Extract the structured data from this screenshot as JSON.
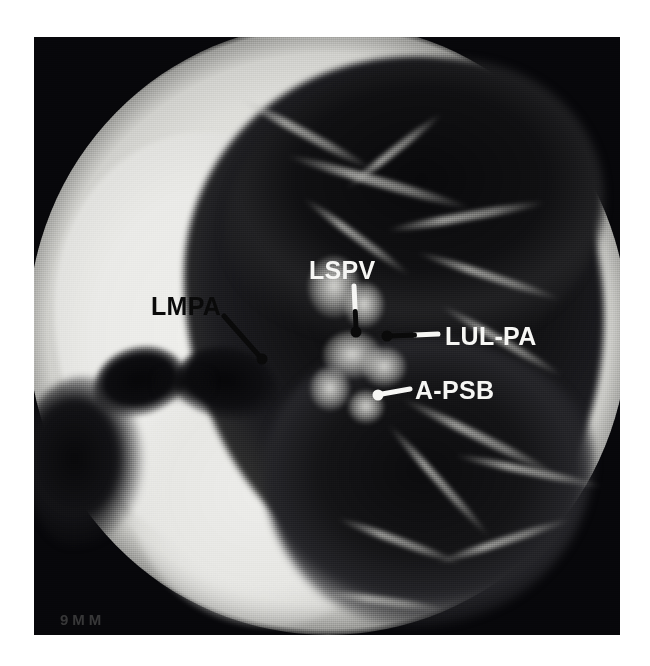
{
  "figure": {
    "modality": "CT",
    "view": "axial",
    "window": "lung window",
    "region": "left hilum / chest",
    "caption_text": ""
  },
  "film": {
    "legend": "9MM",
    "background_color": "#ffffff",
    "film_corner_color": "#07070a",
    "soft_tissue_color": "#e8e8e4",
    "lung_color": "#101012"
  },
  "annotations": [
    {
      "id": "lmpa",
      "label": "LMPA",
      "full_name": "left main pulmonary artery",
      "style": "dark",
      "label_x": 117,
      "label_y": 257,
      "leader": {
        "x1": 190,
        "y1": 279,
        "x2": 228,
        "y2": 322
      },
      "dot": {
        "x": 228,
        "y": 322,
        "r": 5.5,
        "color": "#0a0a0a"
      },
      "line_color": "#0a0a0a",
      "line_width": 5
    },
    {
      "id": "lspv",
      "label": "LSPV",
      "full_name": "left superior pulmonary vein",
      "style": "light",
      "label_x": 275,
      "label_y": 221,
      "leader": {
        "x1": 320,
        "y1": 249,
        "x2": 322,
        "y2": 290
      },
      "leader_light_color": "#f6f6f4",
      "leader_dark_color": "#0a0a0a",
      "split_at": 0.62,
      "dot": {
        "x": 322,
        "y": 295,
        "r": 5.5,
        "color": "#0a0a0a"
      },
      "line_width": 5
    },
    {
      "id": "lul-pa",
      "label": "LUL-PA",
      "full_name": "left upper lobe pulmonary artery",
      "style": "light",
      "label_x": 411,
      "label_y": 287,
      "leader": {
        "x1": 404,
        "y1": 297,
        "x2": 357,
        "y2": 299
      },
      "leader_light_color": "#f6f6f4",
      "leader_dark_color": "#0a0a0a",
      "split_at": 0.5,
      "dot": {
        "x": 353,
        "y": 299,
        "r": 5.5,
        "color": "#0a0a0a"
      },
      "line_width": 5
    },
    {
      "id": "a-psb",
      "label": "A-PSB",
      "full_name": "anterior segmental bronchus",
      "style": "light",
      "label_x": 381,
      "label_y": 341,
      "leader": {
        "x1": 376,
        "y1": 352,
        "x2": 348,
        "y2": 357
      },
      "leader_light_color": "#f6f6f4",
      "split_at": 1.0,
      "dot": {
        "x": 344,
        "y": 358,
        "r": 5.5,
        "color": "#f6f6f4"
      },
      "line_width": 5
    }
  ],
  "vessels": [
    {
      "x": 196,
      "y": 92,
      "w": 150,
      "h": 9,
      "rot": 28
    },
    {
      "x": 250,
      "y": 140,
      "w": 190,
      "h": 10,
      "rot": 16
    },
    {
      "x": 300,
      "y": 110,
      "w": 120,
      "h": 8,
      "rot": -38
    },
    {
      "x": 352,
      "y": 175,
      "w": 160,
      "h": 9,
      "rot": -10
    },
    {
      "x": 258,
      "y": 196,
      "w": 130,
      "h": 8,
      "rot": 36
    },
    {
      "x": 380,
      "y": 235,
      "w": 150,
      "h": 8,
      "rot": 18
    },
    {
      "x": 398,
      "y": 300,
      "w": 140,
      "h": 8,
      "rot": 30
    },
    {
      "x": 360,
      "y": 395,
      "w": 170,
      "h": 9,
      "rot": 26
    },
    {
      "x": 330,
      "y": 440,
      "w": 150,
      "h": 8,
      "rot": 48
    },
    {
      "x": 420,
      "y": 430,
      "w": 150,
      "h": 8,
      "rot": 12
    },
    {
      "x": 300,
      "y": 500,
      "w": 130,
      "h": 8,
      "rot": 20
    },
    {
      "x": 400,
      "y": 500,
      "w": 140,
      "h": 8,
      "rot": -18
    },
    {
      "x": 290,
      "y": 560,
      "w": 120,
      "h": 8,
      "rot": 8
    }
  ],
  "hilum_blobs": [
    {
      "x": 300,
      "y": 250,
      "w": 52,
      "h": 62
    },
    {
      "x": 330,
      "y": 268,
      "w": 40,
      "h": 46
    },
    {
      "x": 318,
      "y": 318,
      "w": 58,
      "h": 48
    },
    {
      "x": 350,
      "y": 330,
      "w": 44,
      "h": 40
    },
    {
      "x": 296,
      "y": 352,
      "w": 40,
      "h": 44
    },
    {
      "x": 332,
      "y": 370,
      "w": 36,
      "h": 34
    }
  ]
}
